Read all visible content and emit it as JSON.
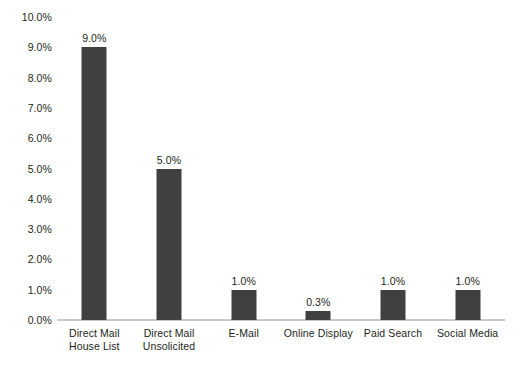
{
  "chart_data": {
    "type": "bar",
    "title": "",
    "subtitle": "",
    "xlabel": "",
    "ylabel": "",
    "ylim": [
      0,
      10
    ],
    "ytick_step": 1,
    "ytick_labels": [
      "0.0%",
      "1.0%",
      "2.0%",
      "3.0%",
      "4.0%",
      "5.0%",
      "6.0%",
      "7.0%",
      "8.0%",
      "9.0%",
      "10.0%"
    ],
    "grid": false,
    "legend": false,
    "orientation": "vertical",
    "categories": [
      "Direct Mail House List",
      "Direct Mail Unsolicited",
      "E-Mail",
      "Online Display",
      "Paid Search",
      "Social Media"
    ],
    "category_lines": [
      [
        "Direct Mail",
        "House List"
      ],
      [
        "Direct Mail",
        "Unsolicited"
      ],
      [
        "E-Mail",
        ""
      ],
      [
        "Online Display",
        ""
      ],
      [
        "Paid Search",
        ""
      ],
      [
        "Social Media",
        ""
      ]
    ],
    "values": [
      9.0,
      5.0,
      1.0,
      0.3,
      1.0,
      1.0
    ],
    "value_labels": [
      "9.0%",
      "5.0%",
      "1.0%",
      "0.3%",
      "1.0%",
      "1.0%"
    ],
    "bar_color": "#404040",
    "baseline_color": "#c9c9c9",
    "text_color": "#231f20",
    "background_color": "#ffffff"
  }
}
